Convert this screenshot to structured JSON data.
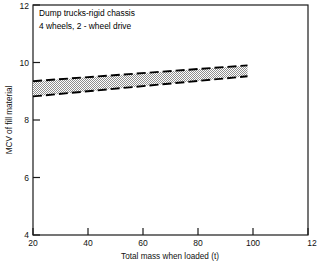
{
  "chart_data": {
    "type": "area",
    "title": "",
    "annotations": [
      "Dump trucks-rigid chassis",
      "4 wheels, 2 - wheel drive"
    ],
    "xlabel": "Total mass when loaded (t)",
    "ylabel": "MCV of fill material",
    "xlim": [
      20,
      120
    ],
    "ylim": [
      4,
      12
    ],
    "xticks": [
      20,
      40,
      60,
      80,
      100,
      120
    ],
    "xtick_labels": [
      "20",
      "40",
      "60",
      "80",
      "100",
      "12"
    ],
    "yticks": [
      4,
      6,
      8,
      10,
      12
    ],
    "ytick_labels": [
      "4",
      "6",
      "8",
      "10",
      "12"
    ],
    "grid": false,
    "legend": "none",
    "series": [
      {
        "name": "MCV band upper bound",
        "x": [
          20,
          98
        ],
        "values": [
          9.35,
          9.9
        ]
      },
      {
        "name": "MCV band lower bound",
        "x": [
          20,
          98
        ],
        "values": [
          8.82,
          9.52
        ]
      }
    ],
    "band": {
      "label": "acceptable MCV range",
      "x_start": 20,
      "x_end": 98,
      "upper_start": 9.35,
      "upper_end": 9.9,
      "lower_start": 8.82,
      "lower_end": 9.52,
      "fill_color": "#b9b9b9",
      "edge_color": "#000000",
      "edge_style": "dashed"
    }
  },
  "colors": {
    "background": "#ffffff",
    "axis": "#1a1a1a",
    "text": "#111111",
    "band_fill": "#b9b9b9",
    "band_edge": "#000000"
  }
}
